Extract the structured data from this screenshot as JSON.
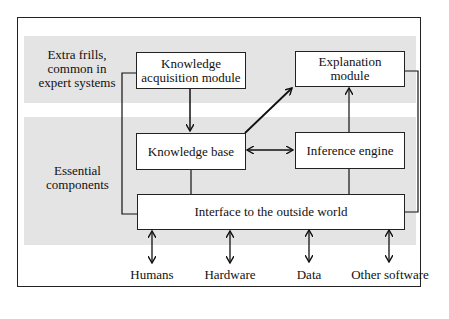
{
  "diagram": {
    "bands": {
      "top_label": "Extra frills, common in expert systems",
      "top_label_lines": [
        "Extra frills,",
        "common in",
        "expert systems"
      ],
      "bottom_label_lines": [
        "Essential",
        "components"
      ]
    },
    "nodes": {
      "knowledge_acquisition": [
        "Knowledge",
        "acquisition module"
      ],
      "explanation": [
        "Explanation",
        "module"
      ],
      "knowledge_base": "Knowledge base",
      "inference_engine": "Inference engine",
      "interface": "Interface to the outside world"
    },
    "external": {
      "humans": "Humans",
      "hardware": "Hardware",
      "data": "Data",
      "other_software": "Other software"
    },
    "edges": [
      {
        "from": "Knowledge acquisition module",
        "to": "Knowledge base",
        "type": "arrow"
      },
      {
        "from": "Knowledge base",
        "to": "Explanation module",
        "type": "arrow"
      },
      {
        "from": "Knowledge base",
        "to": "Inference engine",
        "type": "bidirectional"
      },
      {
        "from": "Inference engine",
        "to": "Explanation module",
        "type": "arrow"
      },
      {
        "from": "Knowledge base",
        "to": "Interface to the outside world",
        "type": "line"
      },
      {
        "from": "Inference engine",
        "to": "Interface to the outside world",
        "type": "line"
      },
      {
        "from": "Knowledge acquisition module",
        "to": "Interface to the outside world",
        "type": "line"
      },
      {
        "from": "Explanation module",
        "to": "Interface to the outside world",
        "type": "line"
      },
      {
        "from": "Interface to the outside world",
        "to": "Humans",
        "type": "bidirectional"
      },
      {
        "from": "Interface to the outside world",
        "to": "Hardware",
        "type": "bidirectional"
      },
      {
        "from": "Interface to the outside world",
        "to": "Data",
        "type": "bidirectional"
      },
      {
        "from": "Interface to the outside world",
        "to": "Other software",
        "type": "bidirectional"
      }
    ]
  }
}
